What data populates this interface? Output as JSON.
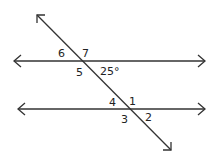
{
  "diagram": {
    "angle_labels": {
      "a1": "1",
      "a2": "2",
      "a3": "3",
      "a4": "4",
      "a5": "5",
      "a6": "6",
      "a7": "7",
      "given": "25°"
    },
    "colors": {
      "line": "#333333",
      "background": "#ffffff"
    }
  }
}
